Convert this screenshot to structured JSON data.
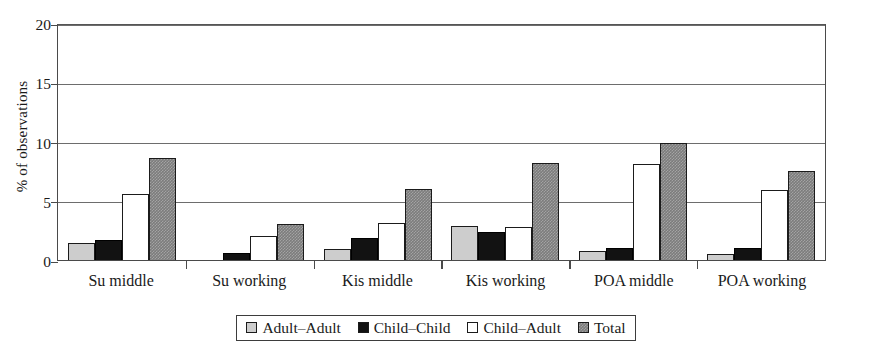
{
  "chart_data": {
    "type": "bar",
    "title": "",
    "subtitle": "",
    "xlabel": "",
    "ylabel": "% of observations",
    "ylim": [
      0,
      20
    ],
    "yticks": [
      0,
      5,
      10,
      15,
      20
    ],
    "ytick_labels": [
      "0",
      "5",
      "10",
      "15",
      "20"
    ],
    "grid": "horizontal",
    "legend_position": "bottom",
    "categories": [
      "Su middle",
      "Su working",
      "Kis middle",
      "Kis working",
      "POA middle",
      "POA working"
    ],
    "series": [
      {
        "name": "Adult–Adult",
        "color": "#cdcdcd",
        "values": [
          1.4,
          0.0,
          0.9,
          2.9,
          0.75,
          0.5
        ]
      },
      {
        "name": "Child–Child",
        "color": "#121212",
        "values": [
          1.7,
          0.6,
          1.9,
          2.4,
          1.0,
          1.0
        ]
      },
      {
        "name": "Child–Adult",
        "color": "#ffffff",
        "values": [
          5.6,
          2.0,
          3.1,
          2.75,
          8.1,
          5.9
        ]
      },
      {
        "name": "Total",
        "color": "#7c7c7c",
        "values": [
          8.6,
          3.0,
          6.0,
          8.2,
          9.85,
          7.5
        ]
      }
    ]
  }
}
